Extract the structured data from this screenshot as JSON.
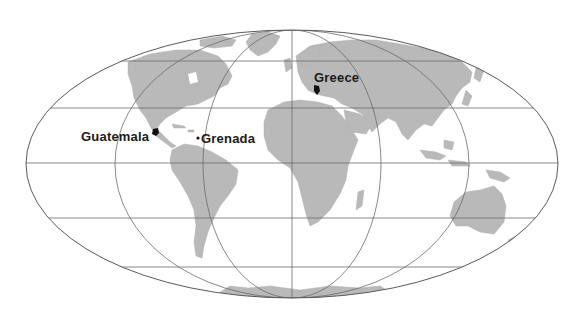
{
  "map": {
    "projection": "Mollweide (elliptical world map)",
    "colors": {
      "land": "#b9b9b9",
      "graticule": "#6b6b6b",
      "outline": "#5a5a5a",
      "marker": "#111111",
      "background": "#ffffff"
    },
    "labels": [
      {
        "id": "guatemala",
        "text": "Guatemala",
        "x": 81,
        "y": 130
      },
      {
        "id": "grenada",
        "text": "Grenada",
        "x": 201,
        "y": 131
      },
      {
        "id": "greece",
        "text": "Greece",
        "x": 314,
        "y": 71
      }
    ],
    "markers": [
      {
        "id": "guatemala",
        "shape": "country-silhouette",
        "x": 155,
        "y": 133
      },
      {
        "id": "grenada",
        "shape": "dot",
        "x": 198,
        "y": 138
      },
      {
        "id": "greece",
        "shape": "country-silhouette",
        "x": 316,
        "y": 89
      }
    ]
  }
}
